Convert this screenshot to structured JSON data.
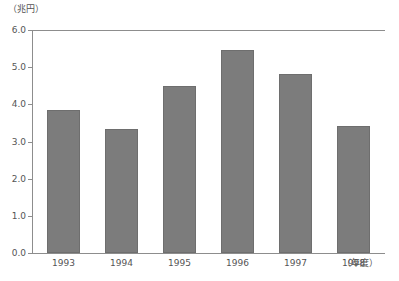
{
  "chart_data": {
    "type": "bar",
    "title": "",
    "subtitle": "",
    "unit_label": "（兆円）",
    "xlabel": "（年度）",
    "ylabel": "",
    "categories": [
      "1993",
      "1994",
      "1995",
      "1996",
      "1997",
      "1998"
    ],
    "values": [
      3.85,
      3.35,
      4.5,
      5.47,
      4.82,
      3.43
    ],
    "series": [
      {
        "name": "",
        "values": [
          3.85,
          3.35,
          4.5,
          5.47,
          4.82,
          3.43
        ]
      }
    ],
    "ylim": [
      0.0,
      6.0
    ],
    "y_ticks": [
      "0.0",
      "1.0",
      "2.0",
      "3.0",
      "4.0",
      "5.0",
      "6.0"
    ],
    "y_tick_values": [
      0.0,
      1.0,
      2.0,
      3.0,
      4.0,
      5.0,
      6.0
    ],
    "grid": false,
    "legend": null,
    "legend_position": "none",
    "annotations": [],
    "colors": {
      "bar_fill": "#7c7c7c",
      "bar_border": "#6e6e6e",
      "axis": "#8d8d8d",
      "text": "#555555",
      "background": "#ffffff"
    }
  }
}
